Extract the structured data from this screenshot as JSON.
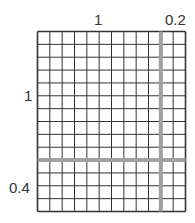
{
  "grid": {
    "columns": 12,
    "rows": 14,
    "left": 37.5,
    "top": 31.5,
    "right": 185.5,
    "bottom": 211.5,
    "line_color": "#333333",
    "highlight_color": "#a0a0a0",
    "highlight_column_index": 10,
    "highlight_row_index": 10
  },
  "labels": {
    "top_center": "1",
    "top_right": "0.2",
    "left_middle": "1",
    "left_bottom": "0.4"
  }
}
